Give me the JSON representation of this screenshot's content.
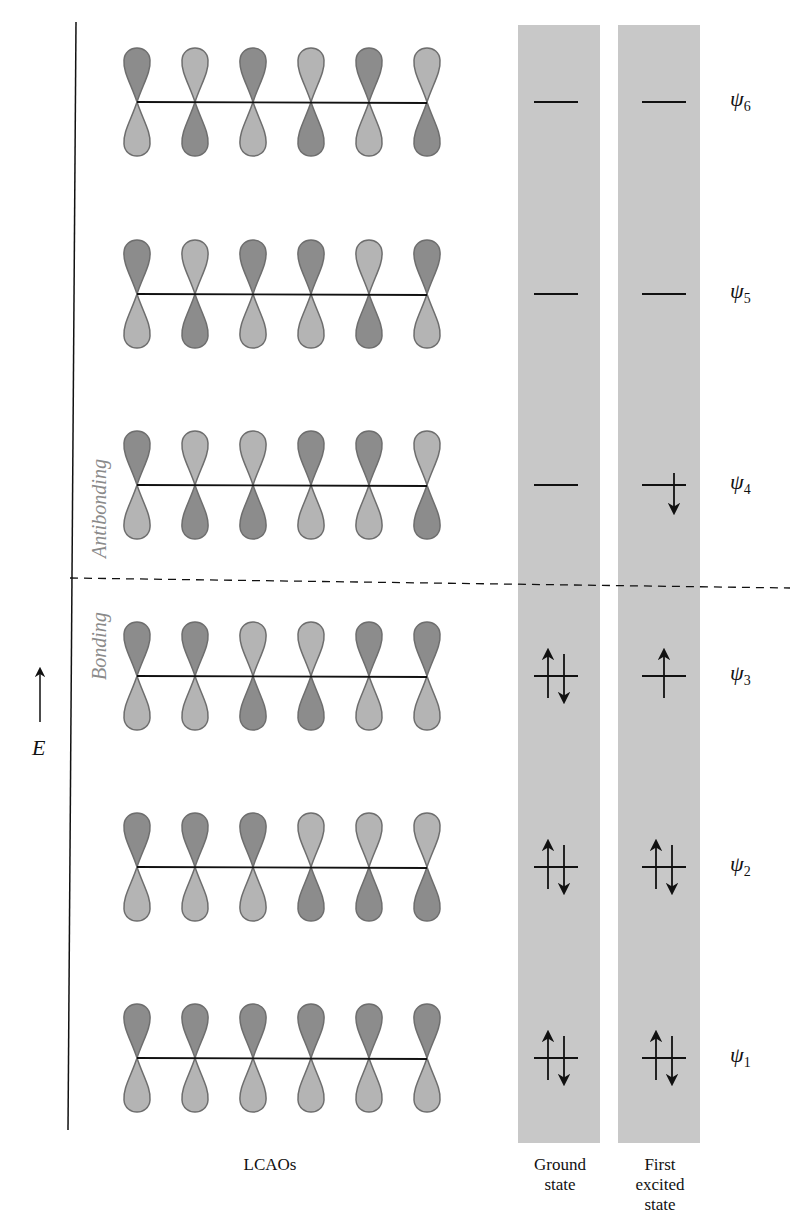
{
  "axis": {
    "label": "E",
    "direction": "up"
  },
  "regions": {
    "antibonding": "Antibonding",
    "bonding": "Bonding"
  },
  "columns": {
    "lcaos": "LCAOs",
    "ground": [
      "Ground",
      "state"
    ],
    "excited": [
      "First",
      "excited",
      "state"
    ]
  },
  "colors": {
    "dark_lobe": "#8c8c8c",
    "light_lobe": "#b4b4b4",
    "lobe_outline": "#6e6e6e",
    "state_band": "#c8c8c8",
    "line": "#111111"
  },
  "orbitals": [
    {
      "name": "ψ6",
      "label": "ψ",
      "sub": "6",
      "y": 102,
      "top_lobes": [
        "D",
        "L",
        "D",
        "L",
        "D",
        "L"
      ],
      "ground": "empty",
      "excited": "empty"
    },
    {
      "name": "ψ5",
      "label": "ψ",
      "sub": "5",
      "y": 294,
      "top_lobes": [
        "D",
        "L",
        "D",
        "D",
        "L",
        "D"
      ],
      "ground": "empty",
      "excited": "empty"
    },
    {
      "name": "ψ4",
      "label": "ψ",
      "sub": "4",
      "y": 485,
      "top_lobes": [
        "D",
        "L",
        "L",
        "D",
        "D",
        "L"
      ],
      "ground": "empty",
      "excited": "down"
    },
    {
      "name": "ψ3",
      "label": "ψ",
      "sub": "3",
      "y": 676,
      "top_lobes": [
        "D",
        "D",
        "L",
        "L",
        "D",
        "D"
      ],
      "ground": "pair",
      "excited": "up"
    },
    {
      "name": "ψ2",
      "label": "ψ",
      "sub": "2",
      "y": 867,
      "top_lobes": [
        "D",
        "D",
        "D",
        "L",
        "L",
        "L"
      ],
      "ground": "pair",
      "excited": "pair"
    },
    {
      "name": "ψ1",
      "label": "ψ",
      "sub": "1",
      "y": 1058,
      "top_lobes": [
        "D",
        "D",
        "D",
        "D",
        "D",
        "D"
      ],
      "ground": "pair",
      "excited": "pair"
    }
  ]
}
